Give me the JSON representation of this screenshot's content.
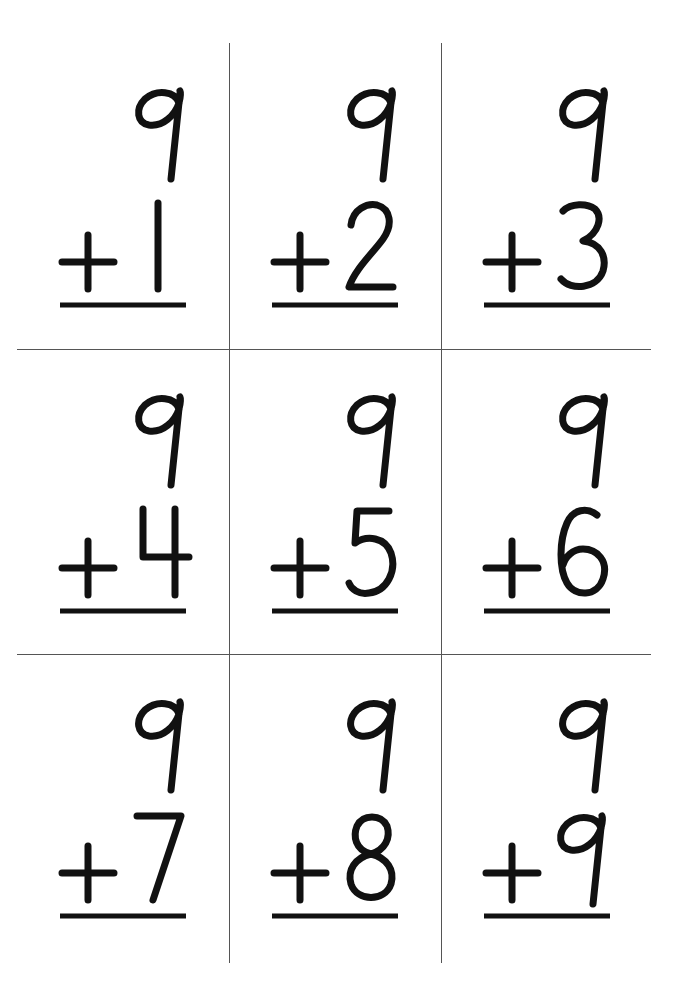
{
  "sheet": {
    "title_hidden": "Addition flash cards: 9 + n",
    "ink_color": "#111111",
    "grid_color": "#555555",
    "background": "#ffffff"
  },
  "cards": [
    {
      "top": "9",
      "operator": "+",
      "bottom": "1",
      "row": 0,
      "col": 0
    },
    {
      "top": "9",
      "operator": "+",
      "bottom": "2",
      "row": 0,
      "col": 1
    },
    {
      "top": "9",
      "operator": "+",
      "bottom": "3",
      "row": 0,
      "col": 2
    },
    {
      "top": "9",
      "operator": "+",
      "bottom": "4",
      "row": 1,
      "col": 0
    },
    {
      "top": "9",
      "operator": "+",
      "bottom": "5",
      "row": 1,
      "col": 1
    },
    {
      "top": "9",
      "operator": "+",
      "bottom": "6",
      "row": 1,
      "col": 2
    },
    {
      "top": "9",
      "operator": "+",
      "bottom": "7",
      "row": 2,
      "col": 0
    },
    {
      "top": "9",
      "operator": "+",
      "bottom": "8",
      "row": 2,
      "col": 1
    },
    {
      "top": "9",
      "operator": "+",
      "bottom": "9",
      "row": 2,
      "col": 2
    }
  ]
}
